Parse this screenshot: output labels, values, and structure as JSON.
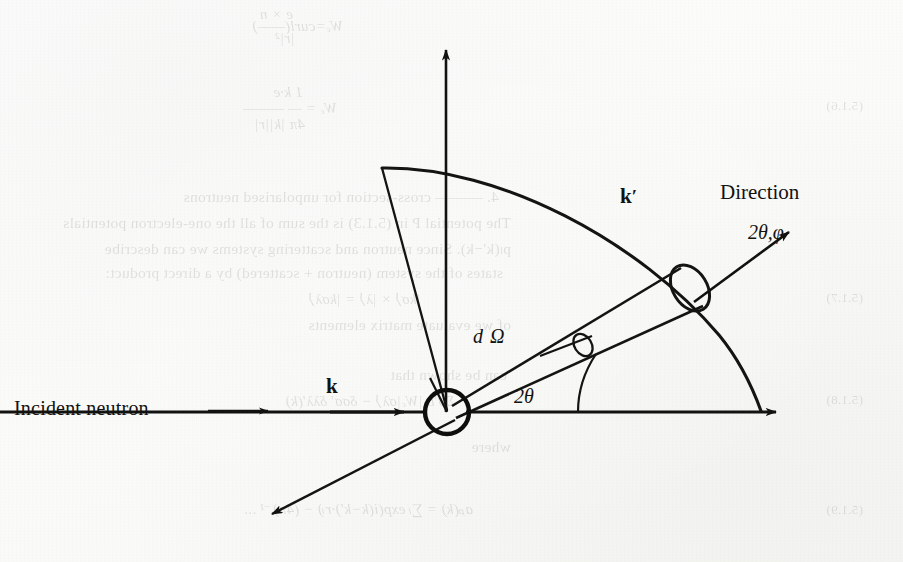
{
  "figure": {
    "domain": "scientific-diagram",
    "caption_present": false,
    "ink_color": "#111110",
    "paper_color": "#fdfdfc",
    "bleed_color": "#3a3a34"
  },
  "labels": {
    "incident_neutron": "Incident neutron",
    "incident_arrow": "⟶",
    "k_incident": "k",
    "k_scattered": "k",
    "k_scattered_prime": "′",
    "direction": "Direction",
    "direction_angles": "2θ,φ",
    "solid_angle": "d Ω",
    "scattering_angle": "2θ"
  },
  "geometry": {
    "scattering_center": {
      "x": 447,
      "y": 412,
      "radius": 22
    },
    "vertical_axis": {
      "x": 446,
      "y_top": 42,
      "y_bottom": 412
    },
    "horizontal_axis": {
      "y": 412,
      "x_left": 0,
      "x_right": 785
    },
    "sector_arc": {
      "start_x": 382,
      "start_y": 168,
      "end_x": 762,
      "end_y": 412
    },
    "cone_aperture": {
      "x": 690,
      "y": 288,
      "rx": 17,
      "ry": 25,
      "rotation": -34
    },
    "domega_marker": {
      "x": 582,
      "y": 345,
      "rx": 8,
      "ry": 12,
      "rotation": -34
    },
    "scattered_ray_arrow": {
      "x": 265,
      "y": 520
    },
    "direction_arrow": {
      "from_x": 690,
      "from_y": 300,
      "to_x": 790,
      "to_y": 228
    },
    "angle_arc_radius": 120
  },
  "bleed_through": {
    "note": "faint mirrored text from reverse of page",
    "lines": [
      {
        "text": "Wₑ=curl(——)",
        "x": 560,
        "y": 18,
        "style": "eq"
      },
      {
        "text": "e × n",
        "x": 610,
        "y": 6,
        "style": "eq"
      },
      {
        "text": "|r|²",
        "x": 608,
        "y": 30,
        "style": "eq"
      },
      {
        "text": "1  k·e",
        "x": 600,
        "y": 84,
        "style": "eq"
      },
      {
        "text": "Wₑ = — ———",
        "x": 566,
        "y": 100,
        "style": "eq"
      },
      {
        "text": "4π  |k||r|",
        "x": 598,
        "y": 116,
        "style": "eq"
      },
      {
        "text": "(5.1.6)",
        "x": 40,
        "y": 98,
        "style": "num"
      },
      {
        "text": "4. ——— cross-section for unpolarised neutrons",
        "x": 404,
        "y": 188,
        "style": "line"
      },
      {
        "text": "The potential  P  in (5.1.3) is the sum of all the one-electron potentials",
        "x": 392,
        "y": 214,
        "style": "line"
      },
      {
        "text": "pₗ(k'−k).  Since neutron and scattering systems we can describe",
        "x": 392,
        "y": 240,
        "style": "line"
      },
      {
        "text": "states of the system (neutron + scattered) by a direct product:",
        "x": 400,
        "y": 264,
        "style": "line"
      },
      {
        "text": "|kσ⟩ × |λ⟩ = |kσλ⟩",
        "x": 482,
        "y": 290,
        "style": "eq"
      },
      {
        "text": "(5.1.7)",
        "x": 40,
        "y": 290,
        "style": "num"
      },
      {
        "text": "of we  evaluate matrix elements",
        "x": 392,
        "y": 316,
        "style": "line"
      },
      {
        "text": "can be shown that",
        "x": 396,
        "y": 366,
        "style": "line"
      },
      {
        "text": "Σσ'b |Wₑ|σλ⟩ − δσσ' δλλ'(k)",
        "x": 448,
        "y": 392,
        "style": "eq"
      },
      {
        "text": "(5.1.8)",
        "x": 40,
        "y": 392,
        "style": "num"
      },
      {
        "text": "where",
        "x": 392,
        "y": 438,
        "style": "line"
      },
      {
        "text": "aₚ(k) = ∑ₗ exp(i(k−k')·rₗ)  −  (4π)⁻¹ ...",
        "x": 430,
        "y": 500,
        "style": "eq"
      },
      {
        "text": "(5.1.9)",
        "x": 40,
        "y": 502,
        "style": "num"
      }
    ]
  }
}
